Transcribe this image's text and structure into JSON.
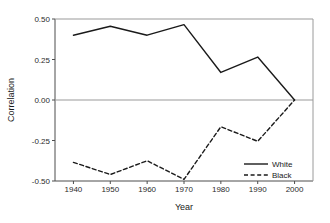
{
  "chart_data": {
    "type": "line",
    "title": "",
    "xlabel": "Year",
    "ylabel": "Correlation",
    "x": [
      1940,
      1950,
      1960,
      1970,
      1980,
      1990,
      2000
    ],
    "xlim": [
      1935,
      2005
    ],
    "ylim": [
      -0.5,
      0.5
    ],
    "xticks": [
      1940,
      1950,
      1960,
      1970,
      1980,
      1990,
      2000
    ],
    "xtick_labels": [
      "1940",
      "1950",
      "1960",
      "1970",
      "1980",
      "1990",
      "2000"
    ],
    "yticks": [
      0.5,
      0.25,
      0.0,
      -0.25,
      -0.5
    ],
    "ytick_labels": [
      "0.50",
      "0.25",
      "0.00",
      "-0.25",
      "-0.50"
    ],
    "grid": false,
    "zero_line": 0.0,
    "legend_position": "lower right",
    "series": [
      {
        "name": "White",
        "style": "solid",
        "color": "#1a1a1a",
        "values": [
          0.4,
          0.455,
          0.4,
          0.465,
          0.17,
          0.265,
          0.0
        ]
      },
      {
        "name": "Black",
        "style": "dashed",
        "color": "#1a1a1a",
        "values": [
          -0.385,
          -0.46,
          -0.375,
          -0.49,
          -0.165,
          -0.255,
          0.0
        ]
      }
    ]
  },
  "axes": {
    "y_title": "Correlation",
    "x_title": "Year",
    "y_labels": [
      "0.50",
      "0.25",
      "0.00",
      "-0.25",
      "-0.50"
    ],
    "x_labels": [
      "1940",
      "1950",
      "1960",
      "1970",
      "1980",
      "1990",
      "2000"
    ]
  },
  "legend": {
    "entries": [
      {
        "label": "White",
        "style": "solid"
      },
      {
        "label": "Black",
        "style": "dashed"
      }
    ]
  },
  "colors": {
    "line": "#1a1a1a",
    "axis": "#4d4d4d",
    "zero_line": "#9a9a9a",
    "top_spine": "#9a9a9a",
    "background": "#ffffff"
  }
}
